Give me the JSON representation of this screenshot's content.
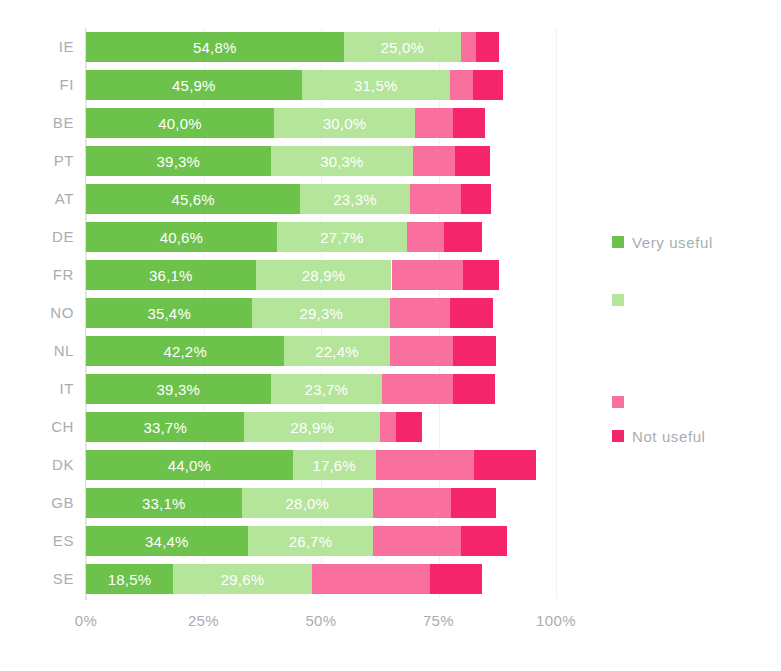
{
  "chart_data": {
    "type": "bar",
    "subtype": "stacked-horizontal-100",
    "title": "",
    "xlabel": "",
    "ylabel": "",
    "xlim": [
      0,
      100
    ],
    "xticks": [
      "0%",
      "25%",
      "50%",
      "75%",
      "100%"
    ],
    "xtick_values": [
      0,
      25,
      50,
      75,
      100
    ],
    "grid": true,
    "legend_position": "right",
    "value_separator": ",",
    "categories": [
      "IE",
      "FI",
      "BE",
      "PT",
      "AT",
      "DE",
      "FR",
      "NO",
      "NL",
      "IT",
      "CH",
      "DK",
      "GB",
      "ES",
      "SE"
    ],
    "series": [
      {
        "name": "Very useful",
        "color": "#6cc24a",
        "values": [
          54.8,
          45.9,
          40.0,
          39.3,
          45.6,
          40.6,
          36.1,
          35.4,
          42.2,
          39.3,
          33.7,
          44.0,
          33.1,
          34.4,
          18.5
        ],
        "labels": [
          "54,8%",
          "45,9%",
          "40,0%",
          "39,3%",
          "45,6%",
          "40,6%",
          "36,1%",
          "35,4%",
          "42,2%",
          "39,3%",
          "33,7%",
          "44,0%",
          "33,1%",
          "34,4%",
          "18,5%"
        ]
      },
      {
        "name": "",
        "color": "#b4e59a",
        "values": [
          25.0,
          31.5,
          30.0,
          30.3,
          23.3,
          27.7,
          28.9,
          29.3,
          22.4,
          23.7,
          28.9,
          17.6,
          28.0,
          26.7,
          29.6
        ],
        "labels": [
          "25,0%",
          "31,5%",
          "30,0%",
          "30,3%",
          "23,3%",
          "27,7%",
          "28,9%",
          "29,3%",
          "22,4%",
          "23,7%",
          "28,9%",
          "17,6%",
          "28,0%",
          "26,7%",
          "29,6%"
        ]
      },
      {
        "name": "",
        "color": "#f9709f",
        "values": [
          3.2,
          5.0,
          8.0,
          9.0,
          10.8,
          7.9,
          15.2,
          12.8,
          13.5,
          15.0,
          3.4,
          20.9,
          16.5,
          18.6,
          25.0
        ],
        "labels": [
          "",
          "",
          "",
          "",
          "",
          "",
          "",
          "",
          "",
          "",
          "",
          "",
          "",
          "",
          ""
        ]
      },
      {
        "name": "Not useful",
        "color": "#f5256b",
        "values": [
          4.9,
          6.4,
          7.0,
          7.4,
          6.5,
          8.0,
          7.6,
          9.2,
          9.2,
          9.0,
          5.5,
          13.2,
          9.6,
          9.9,
          11.2
        ],
        "labels": [
          "",
          "",
          "",
          "",
          "",
          "",
          "",
          "",
          "",
          "",
          "",
          "",
          "",
          "",
          ""
        ]
      }
    ],
    "legend_entries": [
      {
        "label": "Very useful",
        "color": "#6cc24a",
        "index": 0
      },
      {
        "label": "",
        "color": "#b4e59a",
        "index": 1
      },
      {
        "label": "",
        "color": "#f9709f",
        "index": 2
      },
      {
        "label": "Not useful",
        "color": "#f5256b",
        "index": 3
      }
    ]
  },
  "colors": {
    "very_useful": "#6cc24a",
    "rather_useful": "#b4e59a",
    "little_useful": "#f9709f",
    "not_useful": "#f5256b",
    "axis_text": "#a8adb4",
    "gridline": "#eef2f7",
    "background": "#ffffff"
  }
}
